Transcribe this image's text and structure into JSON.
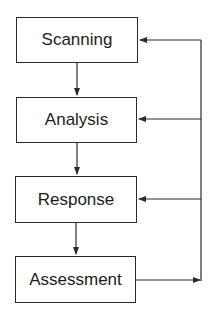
{
  "diagram": {
    "type": "flowchart",
    "nodes": [
      {
        "id": "scanning",
        "label": "Scanning"
      },
      {
        "id": "analysis",
        "label": "Analysis"
      },
      {
        "id": "response",
        "label": "Response"
      },
      {
        "id": "assessment",
        "label": "Assessment"
      }
    ],
    "edges": [
      {
        "from": "scanning",
        "to": "analysis"
      },
      {
        "from": "analysis",
        "to": "response"
      },
      {
        "from": "response",
        "to": "assessment"
      },
      {
        "from": "assessment",
        "to": "feedback-loop"
      },
      {
        "from": "feedback-loop",
        "to": "scanning"
      },
      {
        "from": "feedback-loop",
        "to": "analysis"
      },
      {
        "from": "feedback-loop",
        "to": "response"
      }
    ],
    "line_color": "#2a2a2a"
  }
}
